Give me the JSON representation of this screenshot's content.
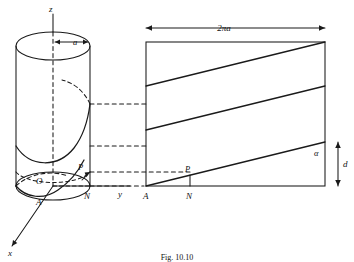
{
  "figure": {
    "caption": "Fig. 10.10",
    "stroke_color": "#1a1a1a",
    "background": "#ffffff"
  },
  "cylinder": {
    "axis_label_z": "z",
    "axis_label_y": "y",
    "axis_label_x": "x",
    "radius_label": "a",
    "origin_label": "O",
    "point_a_label": "A",
    "point_n_label": "N",
    "point_p_label": "P"
  },
  "development": {
    "width_label": "2πa",
    "pitch_label": "d",
    "angle_label": "α",
    "point_a_label": "A",
    "point_n_label": "N",
    "point_p_label": "P"
  }
}
